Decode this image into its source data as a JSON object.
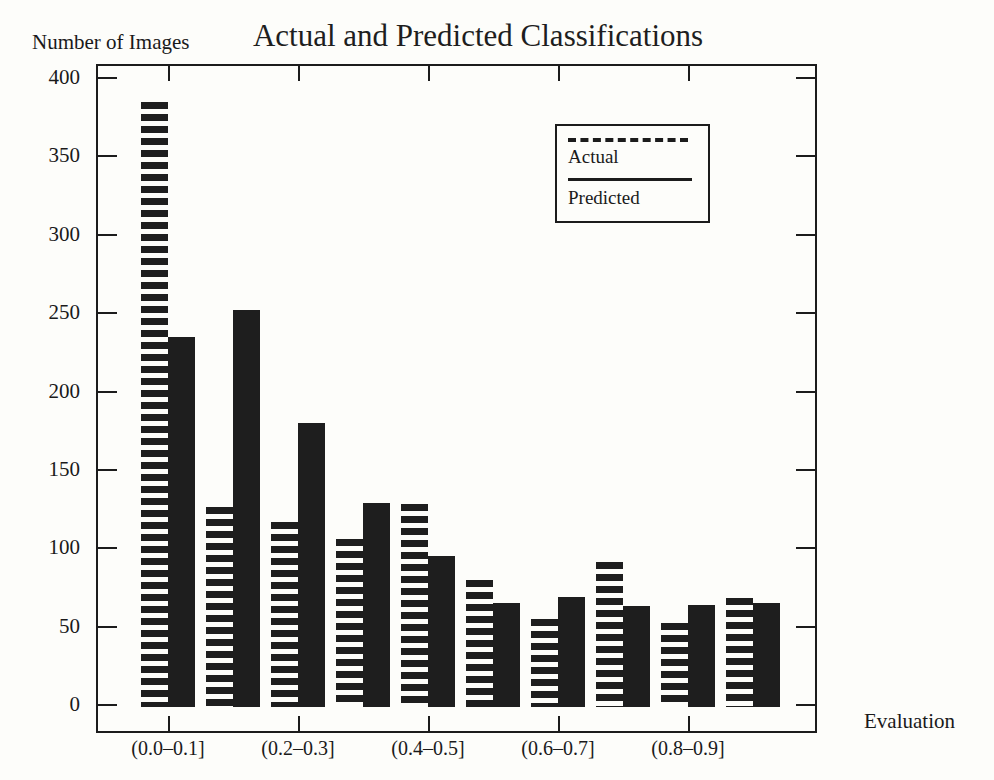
{
  "page": {
    "background": "#fdfdfa",
    "ink_color": "#1c1c1c"
  },
  "chart_data": {
    "type": "bar",
    "title": "Actual and Predicted Classifications",
    "ylabel": "Number of Images",
    "xlabel": "Evaluation",
    "categories": [
      "(0.0-0.1]",
      "(0.1-0.2]",
      "(0.2-0.3]",
      "(0.3-0.4]",
      "(0.4-0.5]",
      "(0.5-0.6]",
      "(0.6-0.7]",
      "(0.7-0.8]",
      "(0.8-0.9]",
      "(0.9-1.0]"
    ],
    "x_tick_labels": [
      "(0.0–0.1]",
      "(0.2–0.3]",
      "(0.4–0.5]",
      "(0.6–0.7]",
      "(0.8–0.9]"
    ],
    "series": [
      {
        "name": "Actual",
        "style": "striped",
        "values": [
          385,
          126,
          117,
          106,
          128,
          80,
          55,
          91,
          52,
          68
        ]
      },
      {
        "name": "Predicted",
        "style": "solid",
        "values": [
          235,
          252,
          180,
          129,
          95,
          65,
          69,
          63,
          64,
          65
        ]
      }
    ],
    "ylim": [
      0,
      400
    ],
    "yticks": [
      0,
      50,
      100,
      150,
      200,
      250,
      300,
      350,
      400
    ],
    "grid": false,
    "legend_position": "upper-right-inside"
  },
  "legend": {
    "items": [
      {
        "label": "Actual",
        "line_style": "dashed"
      },
      {
        "label": "Predicted",
        "line_style": "solid"
      }
    ]
  }
}
